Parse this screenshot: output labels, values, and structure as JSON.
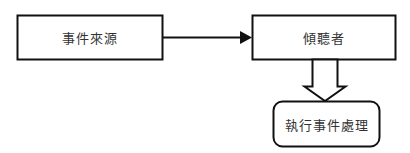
{
  "diagram": {
    "nodes": {
      "event_source": {
        "label": "事件來源",
        "shape": "rectangle"
      },
      "listener": {
        "label": "傾聽者",
        "shape": "rectangle"
      },
      "handler": {
        "label": "執行事件處理",
        "shape": "rounded-rectangle"
      }
    },
    "edges": [
      {
        "from": "event_source",
        "to": "listener",
        "style": "solid-arrow"
      },
      {
        "from": "listener",
        "to": "handler",
        "style": "hollow-block-arrow"
      }
    ],
    "colors": {
      "stroke": "#111111",
      "text": "#333333",
      "background": "#ffffff"
    }
  }
}
